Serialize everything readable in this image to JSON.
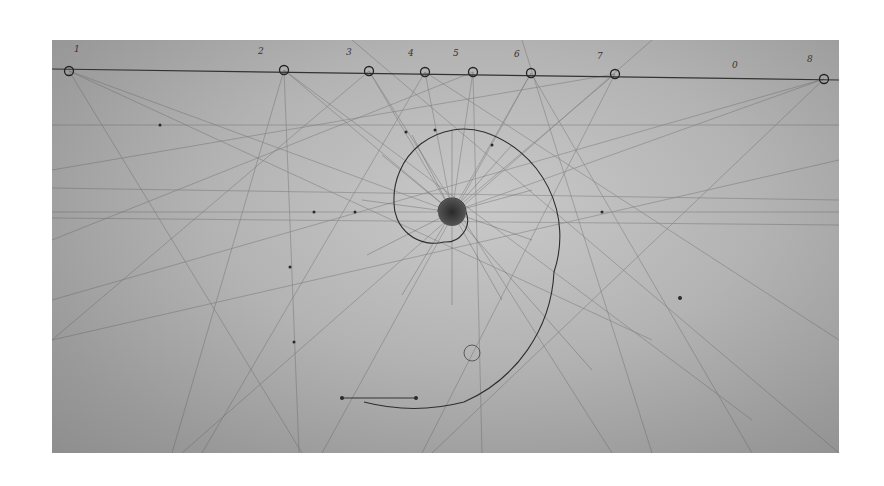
{
  "image": {
    "description": "Photograph of a pencil geometric construction drawing showing a spiral with radiating lines and a numbered baseline",
    "baseline_labels": [
      "1",
      "2",
      "3",
      "4",
      "5",
      "6",
      "7",
      "0",
      "8"
    ],
    "colors": {
      "paper": "#b5b5b5",
      "pencil": "#3a3a3a",
      "background": "#ffffff"
    }
  }
}
